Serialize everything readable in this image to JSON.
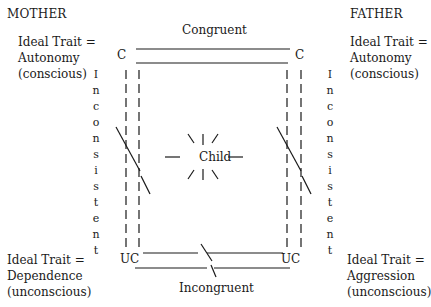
{
  "mother": {
    "heading": "MOTHER",
    "conscious_trait": {
      "line1": "Ideal Trait =",
      "line2": "Autonomy",
      "line3": "(conscious)"
    },
    "unconscious_trait": {
      "line1": "Ideal Trait =",
      "line2": "Dependence",
      "line3": "(unconscious)"
    }
  },
  "father": {
    "heading": "FATHER",
    "conscious_trait": {
      "line1": "Ideal Trait =",
      "line2": "Autonomy",
      "line3": "(conscious)"
    },
    "unconscious_trait": {
      "line1": "Ideal Trait =",
      "line2": "Aggression",
      "line3": "(unconscious)"
    }
  },
  "diagram": {
    "top_label": "Congruent",
    "bottom_label": "Incongruent",
    "center_label": "Child",
    "corner_conscious": "C",
    "corner_unconscious": "UC",
    "side_label": "Inconsistent",
    "side_label_chars": [
      "I",
      "n",
      "c",
      "o",
      "n",
      "s",
      "i",
      "s",
      "t",
      "e",
      "n",
      "t"
    ]
  }
}
